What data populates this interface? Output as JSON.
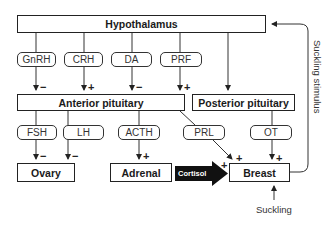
{
  "diagram": {
    "nodes": {
      "hypothalamus": "Hypothalamus",
      "anterior_pituitary": "Anterior pituitary",
      "posterior_pituitary": "Posterior pituitary",
      "ovary": "Ovary",
      "adrenal": "Adrenal",
      "breast": "Breast"
    },
    "hormones": {
      "gnrh": "GnRH",
      "crh": "CRH",
      "da": "DA",
      "prf": "PRF",
      "fsh": "FSH",
      "lh": "LH",
      "acth": "ACTH",
      "prl": "PRL",
      "ot": "OT",
      "cortisol": "Cortisol"
    },
    "signs": {
      "gnrh": "−",
      "crh": "+",
      "da": "−",
      "prf": "+",
      "fsh": "−",
      "lh": "−",
      "acth": "+",
      "prl": "+",
      "ot": "+",
      "cortisol": "+"
    },
    "labels": {
      "suckling": "Suckling",
      "suckling_stimulus": "Suckling stimulus"
    },
    "edges": [
      {
        "from": "Hypothalamus",
        "via": "GnRH",
        "to": "Anterior pituitary",
        "effect": "−"
      },
      {
        "from": "Hypothalamus",
        "via": "CRH",
        "to": "Anterior pituitary",
        "effect": "+"
      },
      {
        "from": "Hypothalamus",
        "via": "DA",
        "to": "Anterior pituitary",
        "effect": "−"
      },
      {
        "from": "Hypothalamus",
        "via": "PRF",
        "to": "Anterior pituitary",
        "effect": "+"
      },
      {
        "from": "Hypothalamus",
        "to": "Posterior pituitary",
        "effect": ""
      },
      {
        "from": "Anterior pituitary",
        "via": "FSH",
        "to": "Ovary",
        "effect": "−"
      },
      {
        "from": "Anterior pituitary",
        "via": "LH",
        "to": "Ovary",
        "effect": "−"
      },
      {
        "from": "Anterior pituitary",
        "via": "ACTH",
        "to": "Adrenal",
        "effect": "+"
      },
      {
        "from": "Anterior pituitary",
        "via": "PRL",
        "to": "Breast",
        "effect": "+"
      },
      {
        "from": "Posterior pituitary",
        "via": "OT",
        "to": "Breast",
        "effect": "+"
      },
      {
        "from": "Adrenal",
        "via": "Cortisol",
        "to": "Breast",
        "effect": "+"
      },
      {
        "from": "Suckling",
        "to": "Breast",
        "effect": ""
      },
      {
        "from": "Breast",
        "via": "Suckling stimulus",
        "to": "Hypothalamus",
        "effect": ""
      }
    ]
  }
}
